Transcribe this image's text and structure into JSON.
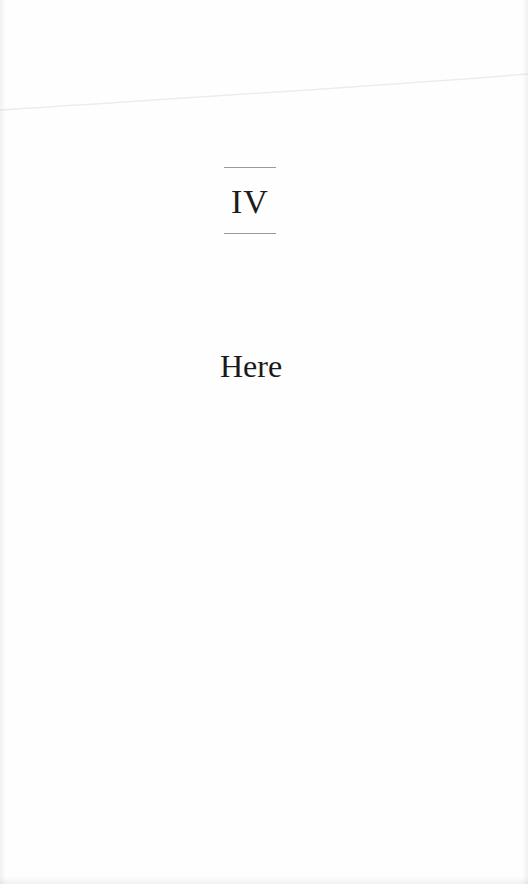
{
  "page": {
    "chapter_number": "IV",
    "chapter_title": "Here"
  },
  "colors": {
    "paper": "#fefefe",
    "text": "#1a1a1a",
    "rule": "#9a9a9a"
  }
}
